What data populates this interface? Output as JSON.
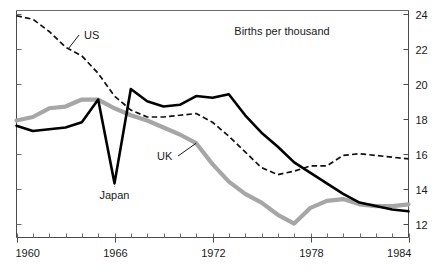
{
  "chart_data": {
    "type": "line",
    "title": "Births per thousand",
    "xlabel": "",
    "ylabel": "Births per thousand",
    "xlim": [
      1960,
      1984
    ],
    "ylim": [
      11.2,
      24.2
    ],
    "yticks": [
      12,
      14,
      16,
      18,
      20,
      22,
      24
    ],
    "ytick_labels": [
      "12",
      "14",
      "16",
      "18",
      "20",
      "22",
      "24"
    ],
    "ytick_side": "right",
    "xticks": [
      1960,
      1966,
      1972,
      1978,
      1984
    ],
    "xtick_labels": [
      "1960",
      "1966",
      "1972",
      "1978",
      "1984"
    ],
    "x_minor_tick_step": 1,
    "grid": false,
    "legend": "inline-annotations",
    "x": [
      1960,
      1961,
      1962,
      1963,
      1964,
      1965,
      1966,
      1967,
      1968,
      1969,
      1970,
      1971,
      1972,
      1973,
      1974,
      1975,
      1976,
      1977,
      1978,
      1979,
      1980,
      1981,
      1982,
      1983,
      1984
    ],
    "series": [
      {
        "name": "US",
        "style": "dashed",
        "color": "#101010",
        "values": [
          23.9,
          23.7,
          23.0,
          22.1,
          21.6,
          20.6,
          19.3,
          18.5,
          18.1,
          18.1,
          18.2,
          18.3,
          17.8,
          17.0,
          16.1,
          15.2,
          14.8,
          15.0,
          15.3,
          15.3,
          15.9,
          16.0,
          15.9,
          15.8,
          15.7
        ],
        "label_position": {
          "x": 1964.6,
          "y": 22.7
        }
      },
      {
        "name": "Japan",
        "style": "solid",
        "color": "#000000",
        "values": [
          17.6,
          17.3,
          17.4,
          17.5,
          17.8,
          19.1,
          14.3,
          19.7,
          19.0,
          18.7,
          18.8,
          19.3,
          19.2,
          19.4,
          18.2,
          17.2,
          16.4,
          15.5,
          14.9,
          14.3,
          13.7,
          13.2,
          13.0,
          12.8,
          12.7
        ],
        "label_position": {
          "x": 1966.2,
          "y": 13.3
        }
      },
      {
        "name": "UK",
        "style": "thick-gray",
        "color": "#a6a6a6",
        "values": [
          17.9,
          18.1,
          18.6,
          18.7,
          19.1,
          19.1,
          18.6,
          18.2,
          17.9,
          17.5,
          17.1,
          16.6,
          15.4,
          14.4,
          13.7,
          13.2,
          12.5,
          12.0,
          12.9,
          13.3,
          13.4,
          13.1,
          13.0,
          13.0,
          13.1
        ],
        "label_position": {
          "x": 1968.9,
          "y": 15.6
        }
      }
    ],
    "annotations": [
      {
        "text": "Births per thousand",
        "x_px": 282,
        "y_px": 32,
        "type": "axis-note"
      },
      {
        "text": "US",
        "leader": "horizontal-left",
        "points_to_year": 1963
      },
      {
        "text": "UK",
        "leader": "horizontal-right",
        "points_to_year": 1971
      },
      {
        "text": "Japan",
        "leader": "vertical-up",
        "points_to_year": 1966
      }
    ]
  },
  "colors": {
    "us_line": "#101010",
    "japan_line": "#000000",
    "uk_line": "#a6a6a6",
    "axis": "#555555",
    "text": "#1a1a1a",
    "background": "#ffffff"
  }
}
